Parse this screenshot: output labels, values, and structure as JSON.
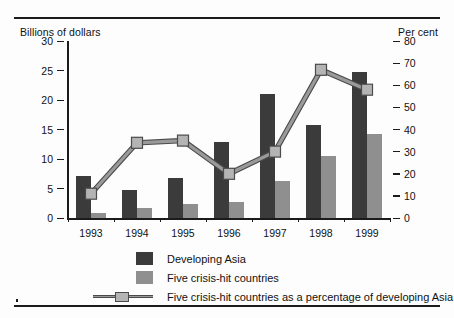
{
  "chart_data": {
    "type": "bar",
    "title": "",
    "subtitle": "",
    "xlabel": "",
    "ylabel": "Billions of dollars",
    "ylabel_right": "Per cent",
    "categories": [
      "1993",
      "1994",
      "1995",
      "1996",
      "1997",
      "1998",
      "1999"
    ],
    "ylim": [
      0,
      30
    ],
    "ylim_right": [
      0,
      80
    ],
    "yticks": [
      0,
      5,
      10,
      15,
      20,
      25,
      30
    ],
    "yticks_right": [
      0,
      10,
      20,
      30,
      40,
      50,
      60,
      70,
      80
    ],
    "grid": false,
    "legend_position": "bottom-left",
    "series": [
      {
        "name": "Developing Asia",
        "type": "bar",
        "axis": "left",
        "color": "#3b3b3b",
        "values": [
          7.1,
          4.7,
          6.8,
          12.8,
          21.0,
          15.8,
          24.8
        ]
      },
      {
        "name": "Five crisis-hit countries",
        "type": "bar",
        "axis": "left",
        "color": "#8f8f8f",
        "values": [
          0.8,
          1.7,
          2.4,
          2.7,
          6.2,
          10.5,
          14.2
        ]
      },
      {
        "name": "Five crisis-hit countries as a percentage of developing Asia",
        "type": "line",
        "axis": "right",
        "color": "#9a9a9a",
        "marker_color": "#b4b4b4",
        "values": [
          11,
          34,
          35,
          20,
          30,
          67,
          58
        ]
      }
    ]
  },
  "axis": {
    "left_title": "Billions of dollars",
    "right_title": "Per cent",
    "left_ticks": [
      "30",
      "25",
      "20",
      "15",
      "10",
      "5",
      "0"
    ],
    "right_ticks": [
      "80",
      "70",
      "60",
      "50",
      "40",
      "30",
      "20",
      "10",
      "0"
    ],
    "x_labels": [
      "1993",
      "1994",
      "1995",
      "1996",
      "1997",
      "1998",
      "1999"
    ]
  },
  "legend": {
    "items": [
      {
        "label": "Developing Asia",
        "kind": "swatch-dark"
      },
      {
        "label": "Five crisis-hit countries",
        "kind": "swatch-light"
      },
      {
        "label": "Five crisis-hit countries as a percentage of developing Asia",
        "kind": "line-marker"
      }
    ]
  }
}
